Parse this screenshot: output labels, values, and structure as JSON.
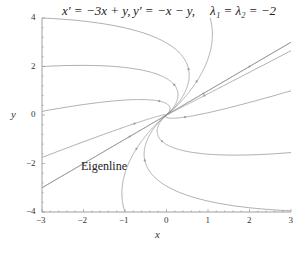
{
  "chart_data": {
    "type": "line",
    "title_parts": [
      "x′ = −3x + y,",
      "y′ = −x − y,",
      "λ₁ = λ₂ = −2"
    ],
    "xlabel": "x",
    "ylabel": "y",
    "xlim": [
      -3,
      3
    ],
    "ylim": [
      -4,
      4
    ],
    "xticks": [
      -3,
      -2,
      -1,
      0,
      1,
      2,
      3
    ],
    "xtick_labels": [
      "−3",
      "−2",
      "−1",
      "0",
      "1",
      "2",
      "3"
    ],
    "yticks": [
      -4,
      -2,
      0,
      2,
      4
    ],
    "ytick_labels": [
      "−4",
      "−2",
      "0",
      "2",
      "4"
    ],
    "grid": false,
    "legend": null,
    "annotation": "Eigenline",
    "system": {
      "a": -3,
      "b": 1,
      "c": -1,
      "d": -1
    },
    "eigenvalue": -2,
    "eigenvector": [
      1,
      1
    ],
    "trajectory_starts": [
      [
        -3,
        4
      ],
      [
        -3,
        2
      ],
      [
        -3,
        0.15
      ],
      [
        -3,
        -1.75
      ],
      [
        -3,
        -3
      ],
      [
        -1,
        -4
      ],
      [
        1.05,
        4
      ],
      [
        3,
        3
      ],
      [
        3,
        2.65
      ],
      [
        3,
        1.0
      ],
      [
        3,
        -1.55
      ],
      [
        3,
        -3.95
      ]
    ],
    "eigenline": {
      "from": [
        -3,
        -3
      ],
      "to": [
        3,
        3
      ]
    },
    "line_color": "#9a9a9a"
  }
}
